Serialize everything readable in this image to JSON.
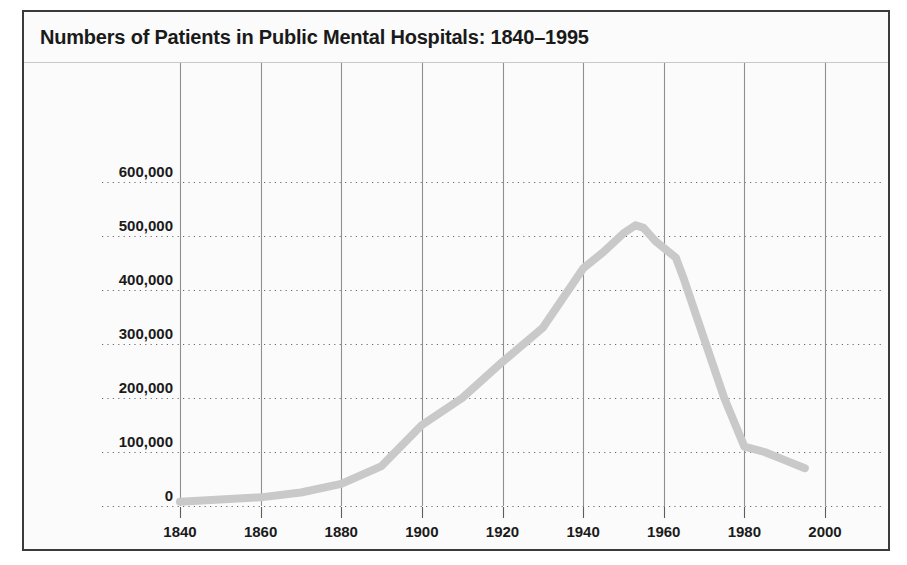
{
  "figure": {
    "title": "Numbers of Patients in Public Mental Hospitals: 1840–1995",
    "border_color": "#3a3a3a",
    "background_color": "#fbfbfb"
  },
  "chart_data": {
    "type": "line",
    "title": "Numbers of Patients in Public Mental Hospitals: 1840–1995",
    "xlabel": "",
    "ylabel": "",
    "xlim": [
      1832,
      2008
    ],
    "ylim": [
      0,
      640000
    ],
    "grid": "dotted-horizontal-and-solid-vertical",
    "legend": "none",
    "line_color": "#c9c9c9",
    "x_tick_labels": [
      "1840",
      "1860",
      "1880",
      "1900",
      "1920",
      "1940",
      "1960",
      "1980",
      "2000"
    ],
    "x_ticks": [
      1840,
      1860,
      1880,
      1900,
      1920,
      1940,
      1960,
      1980,
      2000
    ],
    "y_tick_labels": [
      "0",
      "100,000",
      "200,000",
      "300,000",
      "400,000",
      "500,000",
      "600,000"
    ],
    "y_ticks": [
      0,
      100000,
      200000,
      300000,
      400000,
      500000,
      600000
    ],
    "series": [
      {
        "name": "Patients in public mental hospitals",
        "x": [
          1840,
          1850,
          1860,
          1870,
          1880,
          1890,
          1900,
          1910,
          1920,
          1930,
          1940,
          1945,
          1950,
          1953,
          1955,
          1958,
          1963,
          1965,
          1970,
          1975,
          1980,
          1985,
          1990,
          1995
        ],
        "values": [
          8000,
          12000,
          16000,
          25000,
          41000,
          74000,
          150000,
          200000,
          267000,
          330000,
          440000,
          470000,
          505000,
          520000,
          515000,
          490000,
          460000,
          420000,
          310000,
          200000,
          110000,
          100000,
          85000,
          70000
        ]
      }
    ]
  },
  "axes": {
    "y_tick_label_0": "0",
    "y_tick_label_1": "100,000",
    "y_tick_label_2": "200,000",
    "y_tick_label_3": "300,000",
    "y_tick_label_4": "400,000",
    "y_tick_label_5": "500,000",
    "y_tick_label_6": "600,000",
    "x_tick_label_0": "1840",
    "x_tick_label_1": "1860",
    "x_tick_label_2": "1880",
    "x_tick_label_3": "1900",
    "x_tick_label_4": "1920",
    "x_tick_label_5": "1940",
    "x_tick_label_6": "1960",
    "x_tick_label_7": "1980",
    "x_tick_label_8": "2000"
  }
}
